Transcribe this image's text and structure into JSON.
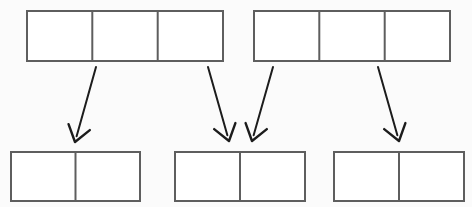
{
  "diagram": {
    "background_color": "#fbfbfb",
    "bar_stroke_color": "#5e5e5e",
    "bar_fill_color": "#ffffff",
    "arrow_color": "#1c1c1c",
    "top_row": {
      "label": "source-bars",
      "bars": [
        {
          "name": "top-bar-left",
          "segments": 3,
          "x": 27,
          "y": 11,
          "width": 196,
          "height": 50,
          "dividers": [
            92.3,
            157.7
          ]
        },
        {
          "name": "top-bar-right",
          "segments": 3,
          "x": 254,
          "y": 11,
          "width": 196,
          "height": 50,
          "dividers": [
            319.3,
            384.7
          ]
        }
      ]
    },
    "bottom_row": {
      "label": "result-bars",
      "bars": [
        {
          "name": "bottom-bar-left",
          "segments": 2,
          "x": 11,
          "y": 152,
          "width": 129,
          "height": 49,
          "dividers": [
            75.5
          ]
        },
        {
          "name": "bottom-bar-middle",
          "segments": 2,
          "x": 175,
          "y": 152,
          "width": 130,
          "height": 49,
          "dividers": [
            240
          ]
        },
        {
          "name": "bottom-bar-right",
          "segments": 2,
          "x": 334,
          "y": 152,
          "width": 130,
          "height": 49,
          "dividers": [
            399
          ]
        }
      ]
    },
    "arrows": [
      {
        "name": "arrow-1",
        "from_bar": "top-bar-left",
        "to_bar": "bottom-bar-left",
        "x1": 96,
        "y1": 67,
        "x2": 75,
        "y2": 142,
        "direction": "down-left"
      },
      {
        "name": "arrow-2",
        "from_bar": "top-bar-left",
        "to_bar": "bottom-bar-middle",
        "x1": 208,
        "y1": 67,
        "x2": 229,
        "y2": 141,
        "direction": "down-right"
      },
      {
        "name": "arrow-3",
        "from_bar": "top-bar-right",
        "to_bar": "bottom-bar-middle",
        "x1": 273,
        "y1": 67,
        "x2": 252,
        "y2": 141,
        "direction": "down-left"
      },
      {
        "name": "arrow-4",
        "from_bar": "top-bar-right",
        "to_bar": "bottom-bar-right",
        "x1": 378,
        "y1": 67,
        "x2": 399,
        "y2": 141,
        "direction": "down-right"
      }
    ]
  }
}
